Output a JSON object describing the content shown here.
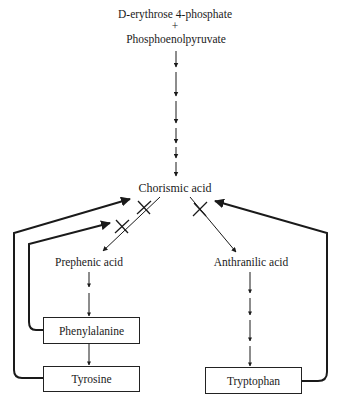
{
  "diagram": {
    "type": "biosynthetic-pathway",
    "precursors": {
      "first": "D-erythrose 4-phosphate",
      "first_prefix": "D",
      "first_rest": "-erythrose 4-phosphate",
      "plus": "+",
      "second": "Phosphoenolpyruvate"
    },
    "nodes": {
      "chorismic": "Chorismic acid",
      "prephenic": "Prephenic acid",
      "anthranilic": "Anthranilic acid",
      "phenylalanine": "Phenylalanine",
      "tyrosine": "Tyrosine",
      "tryptophan": "Tryptophan"
    },
    "edges": [
      {
        "from": "precursors",
        "to": "Chorismic acid",
        "style": "multi-step"
      },
      {
        "from": "Chorismic acid",
        "to": "Prephenic acid",
        "style": "single"
      },
      {
        "from": "Chorismic acid",
        "to": "Anthranilic acid",
        "style": "single"
      },
      {
        "from": "Prephenic acid",
        "to": "Phenylalanine",
        "style": "multi-step"
      },
      {
        "from": "Phenylalanine",
        "to": "Tyrosine",
        "style": "single"
      },
      {
        "from": "Anthranilic acid",
        "to": "Tryptophan",
        "style": "multi-step"
      }
    ],
    "feedback_inhibition": [
      {
        "from": "Phenylalanine",
        "inhibits": "Chorismic acid → Prephenic acid"
      },
      {
        "from": "Tyrosine",
        "inhibits": "Chorismic acid → Prephenic acid"
      },
      {
        "from": "Tryptophan",
        "inhibits": "Chorismic acid → Anthranilic acid"
      }
    ],
    "colors": {
      "line": "#1a1a1a",
      "background": "#ffffff"
    }
  }
}
